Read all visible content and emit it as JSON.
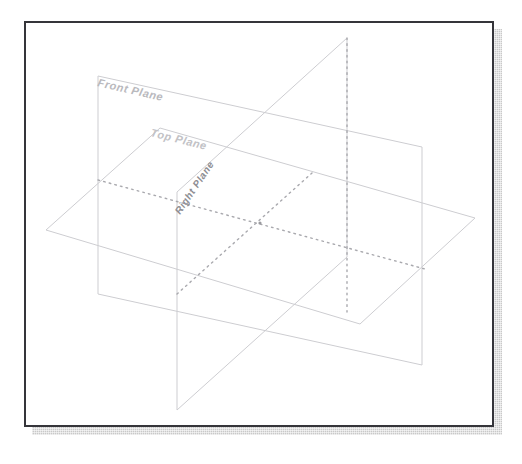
{
  "document": {
    "title": "Reference Planes",
    "background_color": "#ffffff"
  },
  "frame": {
    "border_color": "#35353a",
    "border_width_px": 2,
    "fill_color": "#ffffff",
    "x": 24,
    "y": 21,
    "width": 470,
    "height": 406,
    "shadow": {
      "color": "#c9c9c9",
      "offset_x_px": 8,
      "offset_y_px": 8,
      "texture": "dotted-halftone"
    }
  },
  "diagram": {
    "kind": "orthogonal-reference-planes",
    "origin": {
      "x": 258,
      "y": 221
    },
    "solid_line_color": "#c8c8cc",
    "dotted_line_color": "#a9a9ae",
    "planes": [
      {
        "id": "front-plane",
        "label": "Front Plane",
        "label_color": "#b9b9bd",
        "label_rotation_deg": 13,
        "label_x": 95,
        "label_y": 84,
        "label_font_size": 11,
        "orientation": "vertical-facing-viewer",
        "outline": "96,74 420,145 420,363 96,292",
        "fill": "none"
      },
      {
        "id": "top-plane",
        "label": "Top Plane",
        "label_color": "#c2c2c6",
        "label_rotation_deg": 14,
        "label_x": 148,
        "label_y": 134,
        "label_font_size": 11,
        "orientation": "horizontal",
        "outline": "158,126 473,216 358,322 44,228",
        "fill": "none"
      },
      {
        "id": "right-plane",
        "label": "Right Plane",
        "label_color": "#8e8e93",
        "label_rotation_deg": -56,
        "label_x": 178,
        "label_y": 213,
        "label_font_size": 10,
        "orientation": "vertical-side",
        "outline": "345,36 175,190 175,408 345,255",
        "fill": "none"
      }
    ],
    "intersection_lines": [
      {
        "id": "front-top-intersection",
        "from_x": 96,
        "from_y": 178,
        "to_x": 423,
        "to_y": 267,
        "style": "dotted"
      },
      {
        "id": "front-right-intersection",
        "from_x": 345,
        "from_y": 36,
        "to_x": 345,
        "to_y": 310,
        "style": "dotted"
      },
      {
        "id": "top-right-intersection",
        "from_x": 175,
        "from_y": 292,
        "to_x": 310,
        "to_y": 171,
        "style": "dotted"
      }
    ]
  }
}
